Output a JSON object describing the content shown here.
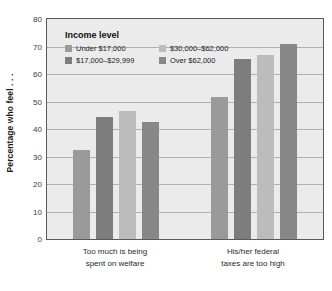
{
  "chart_data": {
    "type": "bar",
    "title": "",
    "subtitle": "",
    "xlabel": "",
    "ylabel": "Percentage who feel . . .",
    "ylim": [
      0,
      80
    ],
    "ytick_step": 10,
    "yticks": [
      80,
      70,
      60,
      50,
      40,
      30,
      20,
      10,
      0
    ],
    "grid": true,
    "legend_position": "inside-top-left",
    "legend_title": "Income level",
    "categories": [
      "Too much is being spent on welfare",
      "His/her federal taxes are too high"
    ],
    "category_lines": [
      [
        "Too much is being",
        "spent on welfare"
      ],
      [
        "His/her federal",
        "taxes are too high"
      ]
    ],
    "series": [
      {
        "name": "Under $17,000",
        "color": "#9a9a9a",
        "values": [
          32.5,
          51.5
        ]
      },
      {
        "name": "$17,000–$29,999",
        "color": "#7d7d7d",
        "values": [
          44.5,
          65.5
        ]
      },
      {
        "name": "$30,000–$62,000",
        "color": "#bcbcbc",
        "values": [
          46.5,
          67.0
        ]
      },
      {
        "name": "Over $62,000",
        "color": "#878787",
        "values": [
          42.5,
          71.0
        ]
      }
    ]
  },
  "style": {
    "plot_background": "#ebebeb",
    "plot_border": "#5a5a5a",
    "gridline_color": "#b0b0b0",
    "page_background": "#ffffff",
    "text_color": "#222222"
  }
}
